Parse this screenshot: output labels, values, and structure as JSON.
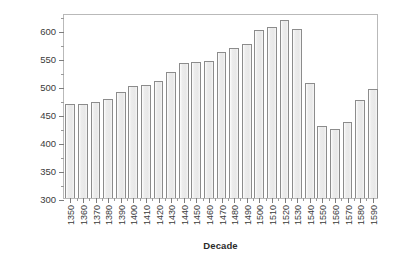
{
  "chart_data": {
    "type": "bar",
    "title": "",
    "xlabel": "Decade",
    "ylabel": "Number of institutions",
    "categories": [
      "1350",
      "1360",
      "1370",
      "1380",
      "1390",
      "1400",
      "1410",
      "1420",
      "1430",
      "1440",
      "1450",
      "1460",
      "1470",
      "1480",
      "1490",
      "1500",
      "1510",
      "1520",
      "1530",
      "1540",
      "1550",
      "1560",
      "1570",
      "1580",
      "1590"
    ],
    "values": [
      468,
      468,
      471,
      477,
      490,
      499,
      501,
      509,
      525,
      540,
      543,
      545,
      560,
      567,
      574,
      600,
      605,
      617,
      601,
      505,
      429,
      423,
      436,
      475,
      494
    ],
    "ylim": [
      300,
      630
    ],
    "yticks": [
      300,
      350,
      400,
      450,
      500,
      550,
      600
    ],
    "ytick_labels": [
      "300",
      "350",
      "400",
      "450",
      "500",
      "550",
      "600"
    ],
    "y_minor_ticks": [
      325,
      375,
      425,
      475,
      525,
      575,
      625
    ],
    "grid": false,
    "legend": null,
    "bar_fill": "#efefef",
    "bar_stroke": "#8c8c8c",
    "frame_color": "#b9b9b9",
    "text_color": "#2b2b2b"
  }
}
